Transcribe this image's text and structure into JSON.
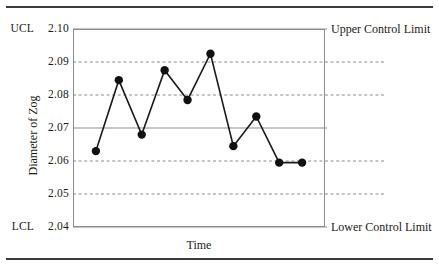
{
  "figure": {
    "has_top_rule": true,
    "has_bottom_rule": true
  },
  "chart_data": {
    "type": "line",
    "title": "",
    "subtitle": "",
    "xlabel": "Time",
    "ylabel": "Diameter of Zog",
    "x": [
      1,
      2,
      3,
      4,
      5,
      6,
      7,
      8,
      9,
      10
    ],
    "values": [
      2.063,
      2.0845,
      2.068,
      2.0875,
      2.0785,
      2.0925,
      2.0645,
      2.0735,
      2.0595,
      2.0595
    ],
    "series": [
      {
        "name": "Diameter of Zog",
        "values": [
          2.063,
          2.0845,
          2.068,
          2.0875,
          2.0785,
          2.0925,
          2.0645,
          2.0735,
          2.0595,
          2.0595
        ]
      }
    ],
    "categories": [
      "",
      "",
      "",
      "",
      "",
      "",
      "",
      "",
      "",
      ""
    ],
    "ylim": [
      2.04,
      2.1
    ],
    "yticks": [
      2.1,
      2.09,
      2.08,
      2.07,
      2.06,
      2.05,
      2.04
    ],
    "ytick_labels": [
      "2.10",
      "2.09",
      "2.08",
      "2.07",
      "2.06",
      "2.05",
      "2.04"
    ],
    "grid": true,
    "grid_style": "dashed",
    "gridlines_dashed": [
      2.09,
      2.08,
      2.06,
      2.05
    ],
    "gridlines_solid": [
      2.1,
      2.07,
      2.04
    ],
    "legend_position": "none",
    "xticks": [],
    "xtick_labels": [],
    "line_color": "#1a1a1a",
    "marker": "circle",
    "marker_color": "#111111",
    "gridline_color": "#8c8c8c",
    "control_limits": {
      "upper": 2.1,
      "center": 2.07,
      "lower": 2.04,
      "upper_tag": "UCL",
      "lower_tag": "LCL",
      "upper_annotation": "Upper Control Limit",
      "lower_annotation": "Lower Control Limit"
    },
    "annotations": [
      "Upper Control Limit",
      "Lower Control Limit"
    ]
  }
}
